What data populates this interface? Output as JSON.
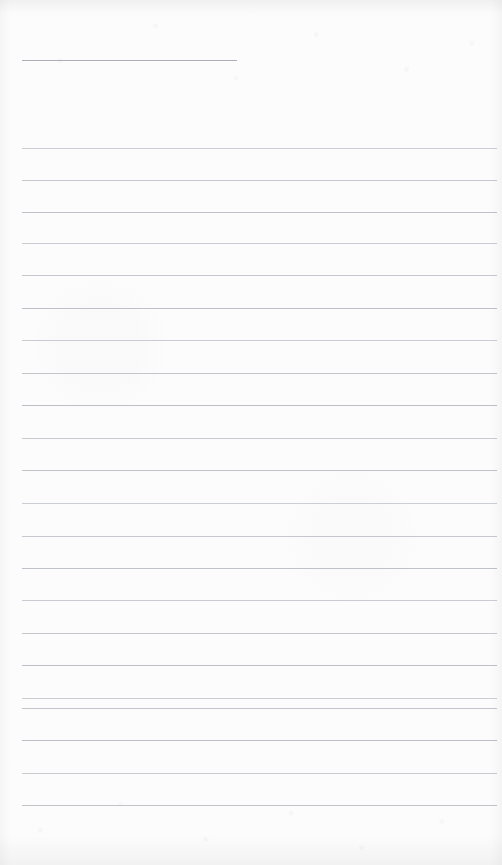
{
  "document": {
    "kind": "scanned-lined-paper",
    "title": "",
    "body_text": "",
    "is_blank": true,
    "page_width": 502,
    "page_height": 865
  },
  "appearance": {
    "paper_color": "#fcfcfc",
    "rule_color": "#b9bcc2",
    "header_rule_color": "#a7aab1"
  },
  "ruling": {
    "left_margin": 22,
    "right_edge": 497,
    "line_spacing": 32.8,
    "header_rule": {
      "y": 60,
      "x_start": 22,
      "x_end": 237
    },
    "lines_y": [
      148,
      180,
      212,
      243,
      275,
      308,
      340,
      373,
      405,
      438,
      470,
      503,
      536,
      568,
      600,
      633,
      665,
      698,
      708,
      740,
      773,
      805
    ]
  }
}
